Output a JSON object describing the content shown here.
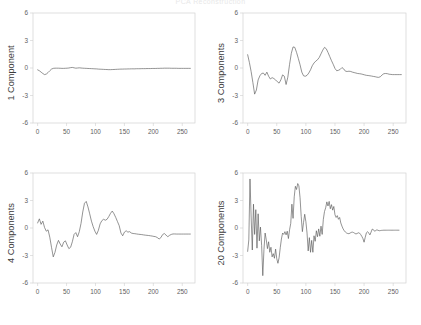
{
  "figure": {
    "title": "PCA Reconstruction",
    "background_color": "#ffffff",
    "line_color": "#5a5a5a",
    "axis_color": "#d2d2d2",
    "rows": 2,
    "columns": 2
  },
  "axes": {
    "y_ticks": [
      "-6",
      "-3",
      "0",
      "3",
      "6"
    ],
    "y_tick_values": [
      -6,
      -3,
      0,
      3,
      6
    ],
    "x_ticks": [
      "0",
      "50",
      "100",
      "150",
      "200",
      "250"
    ],
    "x_tick_values": [
      0,
      50,
      100,
      150,
      200,
      250
    ],
    "ylim": [
      -6,
      6
    ],
    "xlim": [
      -8,
      272
    ]
  },
  "panels": [
    {
      "id": "panel-1-component",
      "ylabel": "1 Component",
      "position": "top-left"
    },
    {
      "id": "panel-3-components",
      "ylabel": "3 Components",
      "position": "top-right"
    },
    {
      "id": "panel-4-components",
      "ylabel": "4 Components",
      "position": "bottom-left"
    },
    {
      "id": "panel-20-components",
      "ylabel": "20 Components",
      "position": "bottom-right"
    }
  ],
  "chart_data": [
    {
      "type": "line",
      "title": "1 Component",
      "xlabel": "",
      "ylabel": "1 Component",
      "xlim": [
        -8,
        272
      ],
      "ylim": [
        -6,
        6
      ],
      "grid": false,
      "legend": false,
      "x": [
        0,
        3,
        6,
        9,
        12,
        15,
        18,
        21,
        24,
        27,
        30,
        33,
        36,
        39,
        42,
        45,
        48,
        51,
        54,
        57,
        60,
        63,
        66,
        69,
        72,
        75,
        78,
        81,
        84,
        87,
        90,
        93,
        96,
        99,
        102,
        105,
        108,
        111,
        114,
        117,
        120,
        123,
        126,
        129,
        132,
        135,
        138,
        141,
        144,
        147,
        150,
        153,
        156,
        159,
        162,
        165,
        168,
        171,
        174,
        177,
        180,
        183,
        186,
        189,
        192,
        195,
        198,
        201,
        204,
        207,
        210,
        213,
        216,
        219,
        222,
        225,
        228,
        231,
        234,
        237,
        240,
        243,
        246,
        249,
        252,
        255,
        258,
        261,
        264
      ],
      "y": [
        -0.2,
        -0.3,
        -0.45,
        -0.6,
        -0.72,
        -0.66,
        -0.5,
        -0.3,
        -0.12,
        -0.04,
        -0.02,
        -0.02,
        -0.02,
        -0.03,
        -0.04,
        -0.04,
        -0.03,
        -0.02,
        0.0,
        0.04,
        0.06,
        0.02,
        -0.02,
        0.0,
        0.02,
        0.0,
        -0.02,
        -0.03,
        -0.04,
        -0.05,
        -0.06,
        -0.07,
        -0.08,
        -0.09,
        -0.1,
        -0.12,
        -0.13,
        -0.14,
        -0.15,
        -0.16,
        -0.17,
        -0.18,
        -0.18,
        -0.17,
        -0.16,
        -0.15,
        -0.14,
        -0.13,
        -0.12,
        -0.12,
        -0.11,
        -0.11,
        -0.1,
        -0.1,
        -0.09,
        -0.09,
        -0.09,
        -0.08,
        -0.08,
        -0.08,
        -0.07,
        -0.07,
        -0.07,
        -0.06,
        -0.06,
        -0.06,
        -0.05,
        -0.05,
        -0.05,
        -0.04,
        -0.04,
        -0.03,
        -0.03,
        -0.02,
        -0.02,
        -0.02,
        -0.02,
        -0.03,
        -0.03,
        -0.03,
        -0.03,
        -0.04,
        -0.04,
        -0.04,
        -0.04,
        -0.04,
        -0.04,
        -0.04,
        -0.04
      ]
    },
    {
      "type": "line",
      "title": "3 Components",
      "xlabel": "",
      "ylabel": "3 Components",
      "xlim": [
        -8,
        272
      ],
      "ylim": [
        -6,
        6
      ],
      "grid": false,
      "legend": false,
      "x": [
        0,
        3,
        6,
        9,
        12,
        15,
        18,
        21,
        24,
        27,
        30,
        33,
        36,
        39,
        42,
        45,
        48,
        51,
        54,
        57,
        60,
        63,
        66,
        69,
        72,
        75,
        78,
        81,
        84,
        87,
        90,
        93,
        96,
        99,
        102,
        105,
        108,
        111,
        114,
        117,
        120,
        123,
        126,
        129,
        132,
        135,
        138,
        141,
        144,
        147,
        150,
        153,
        156,
        159,
        162,
        165,
        168,
        171,
        174,
        177,
        180,
        183,
        186,
        189,
        192,
        195,
        198,
        201,
        204,
        207,
        210,
        213,
        216,
        219,
        222,
        225,
        228,
        231,
        234,
        237,
        240,
        243,
        246,
        249,
        252,
        255,
        258,
        261,
        264
      ],
      "y": [
        1.45,
        0.6,
        -0.4,
        -1.6,
        -2.85,
        -2.4,
        -1.3,
        -0.85,
        -0.6,
        -0.55,
        -0.8,
        -0.45,
        -0.9,
        -1.2,
        -1.05,
        -1.15,
        -1.3,
        -1.5,
        -1.65,
        -1.3,
        -0.75,
        -0.9,
        -1.8,
        -1.0,
        0.4,
        1.6,
        2.3,
        2.25,
        1.7,
        1.05,
        0.35,
        -0.45,
        -0.85,
        -0.9,
        -0.8,
        -0.55,
        -0.2,
        0.25,
        0.55,
        0.75,
        0.9,
        1.15,
        1.55,
        1.95,
        2.25,
        2.1,
        1.7,
        1.25,
        0.8,
        0.4,
        -0.05,
        -0.3,
        -0.25,
        -0.15,
        0.05,
        -0.1,
        -0.35,
        -0.38,
        -0.35,
        -0.38,
        -0.45,
        -0.5,
        -0.55,
        -0.6,
        -0.62,
        -0.65,
        -0.7,
        -0.75,
        -0.8,
        -0.82,
        -0.85,
        -0.88,
        -0.92,
        -0.95,
        -1.0,
        -1.02,
        -0.95,
        -0.75,
        -0.62,
        -0.6,
        -0.62,
        -0.68,
        -0.7,
        -0.72,
        -0.72,
        -0.72,
        -0.72,
        -0.72,
        -0.72
      ]
    },
    {
      "type": "line",
      "title": "4 Components",
      "xlabel": "",
      "ylabel": "4 Components",
      "xlim": [
        -8,
        272
      ],
      "ylim": [
        -6,
        6
      ],
      "grid": false,
      "legend": false,
      "x": [
        0,
        3,
        6,
        9,
        12,
        15,
        18,
        21,
        24,
        27,
        30,
        33,
        36,
        39,
        42,
        45,
        48,
        51,
        54,
        57,
        60,
        63,
        66,
        69,
        72,
        75,
        78,
        81,
        84,
        87,
        90,
        93,
        96,
        99,
        102,
        105,
        108,
        111,
        114,
        117,
        120,
        123,
        126,
        129,
        132,
        135,
        138,
        141,
        144,
        147,
        150,
        153,
        156,
        159,
        162,
        165,
        168,
        171,
        174,
        177,
        180,
        183,
        186,
        189,
        192,
        195,
        198,
        201,
        204,
        207,
        210,
        213,
        216,
        219,
        222,
        225,
        228,
        231,
        234,
        237,
        240,
        243,
        246,
        249,
        252,
        255,
        258,
        261,
        264
      ],
      "y": [
        0.55,
        1.0,
        0.4,
        0.75,
        0.05,
        -0.35,
        -0.2,
        -1.0,
        -2.1,
        -3.15,
        -2.65,
        -1.85,
        -1.35,
        -1.75,
        -2.05,
        -1.55,
        -1.4,
        -1.85,
        -2.25,
        -2.1,
        -1.5,
        -0.7,
        -0.5,
        -0.95,
        -0.4,
        0.5,
        1.75,
        2.7,
        2.9,
        2.3,
        1.55,
        0.75,
        0.15,
        -0.35,
        -0.7,
        -0.25,
        0.45,
        0.8,
        0.95,
        0.85,
        0.95,
        1.25,
        1.6,
        1.85,
        1.55,
        1.15,
        0.7,
        0.25,
        -0.55,
        -0.85,
        -0.45,
        -0.3,
        -0.45,
        -0.4,
        -0.55,
        -0.6,
        -0.62,
        -0.65,
        -0.68,
        -0.7,
        -0.72,
        -0.75,
        -0.78,
        -0.8,
        -0.82,
        -0.85,
        -0.88,
        -0.92,
        -0.95,
        -1.05,
        -1.2,
        -1.05,
        -0.72,
        -0.6,
        -0.78,
        -0.95,
        -0.8,
        -0.7,
        -0.65,
        -0.65,
        -0.66,
        -0.66,
        -0.66,
        -0.66,
        -0.66,
        -0.66,
        -0.66,
        -0.66,
        -0.66
      ]
    },
    {
      "type": "line",
      "title": "20 Components",
      "xlabel": "",
      "ylabel": "20 Components",
      "xlim": [
        -8,
        272
      ],
      "ylim": [
        -6,
        6
      ],
      "grid": false,
      "legend": false,
      "x": [
        0,
        2,
        4,
        6,
        8,
        10,
        12,
        14,
        16,
        18,
        20,
        22,
        24,
        26,
        28,
        30,
        32,
        34,
        36,
        38,
        40,
        42,
        44,
        46,
        48,
        50,
        52,
        54,
        56,
        58,
        60,
        62,
        64,
        66,
        68,
        70,
        72,
        74,
        76,
        78,
        80,
        82,
        84,
        86,
        88,
        90,
        92,
        94,
        96,
        98,
        100,
        102,
        104,
        106,
        108,
        110,
        112,
        114,
        116,
        118,
        120,
        122,
        124,
        126,
        128,
        130,
        132,
        134,
        136,
        138,
        140,
        142,
        144,
        146,
        148,
        150,
        152,
        154,
        156,
        158,
        160,
        162,
        164,
        166,
        168,
        170,
        172,
        174,
        176,
        178,
        180,
        182,
        184,
        186,
        188,
        190,
        192,
        194,
        196,
        198,
        200,
        202,
        204,
        206,
        208,
        210,
        212,
        214,
        216,
        218,
        220,
        222,
        224,
        226,
        228,
        230,
        232,
        234,
        236,
        238,
        240,
        242,
        244,
        246,
        248,
        250,
        252,
        254,
        256,
        258,
        260,
        262,
        264
      ],
      "y": [
        -2.55,
        -1.3,
        5.35,
        1.2,
        -2.4,
        2.6,
        -0.7,
        2.0,
        -2.2,
        1.55,
        -1.4,
        0.1,
        -1.9,
        -5.2,
        -2.35,
        -0.55,
        -1.3,
        -2.25,
        -1.5,
        -2.65,
        -2.1,
        -3.15,
        -2.8,
        -3.3,
        -2.3,
        -3.35,
        -3.85,
        -3.25,
        -2.15,
        -1.2,
        -0.55,
        -0.7,
        -0.4,
        -0.75,
        -0.35,
        -1.15,
        -0.2,
        0.5,
        2.6,
        1.05,
        3.4,
        4.55,
        4.2,
        4.85,
        4.6,
        3.3,
        1.25,
        -0.4,
        0.6,
        1.5,
        0.7,
        -0.55,
        -2.5,
        -1.05,
        -2.65,
        -1.35,
        -2.65,
        -0.85,
        -1.45,
        -0.3,
        -0.95,
        -0.1,
        -0.9,
        0.2,
        -0.7,
        0.95,
        1.8,
        2.2,
        2.85,
        2.4,
        2.9,
        2.1,
        2.55,
        1.95,
        2.35,
        1.45,
        1.15,
        1.35,
        0.95,
        1.15,
        0.55,
        0.2,
        -0.1,
        -0.3,
        -0.45,
        -0.55,
        -0.6,
        -0.62,
        -0.55,
        -0.48,
        -0.45,
        -0.5,
        -0.58,
        -0.65,
        -0.6,
        -0.52,
        -0.55,
        -0.7,
        -0.9,
        -1.15,
        -1.55,
        -1.0,
        -0.52,
        -0.4,
        -0.55,
        -0.75,
        -0.45,
        -0.12,
        -0.18,
        -0.35,
        -0.28,
        -0.2,
        -0.25,
        -0.3,
        -0.28,
        -0.26,
        -0.25,
        -0.24,
        -0.24,
        -0.24,
        -0.24,
        -0.24,
        -0.24,
        -0.24,
        -0.24,
        -0.24,
        -0.24,
        -0.24,
        -0.24,
        -0.24,
        -0.24
      ]
    }
  ]
}
